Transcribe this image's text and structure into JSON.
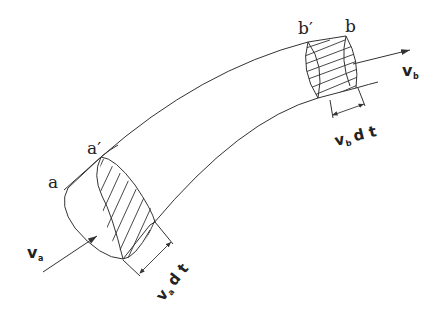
{
  "diagram": {
    "labels": {
      "a": "a",
      "a_prime": "a′",
      "b": "b",
      "b_prime": "b′",
      "v_a": "v",
      "v_a_sub": "a",
      "v_b": "v",
      "v_b_sub": "b",
      "va_dt_v": "v",
      "va_dt_sub": "a",
      "va_dt_rest": " d t",
      "vb_dt_v": "v",
      "vb_dt_sub": "b",
      "vb_dt_rest": " d t"
    },
    "colors": {
      "line": "#333333",
      "text": "#222222",
      "background": "#ffffff"
    }
  }
}
